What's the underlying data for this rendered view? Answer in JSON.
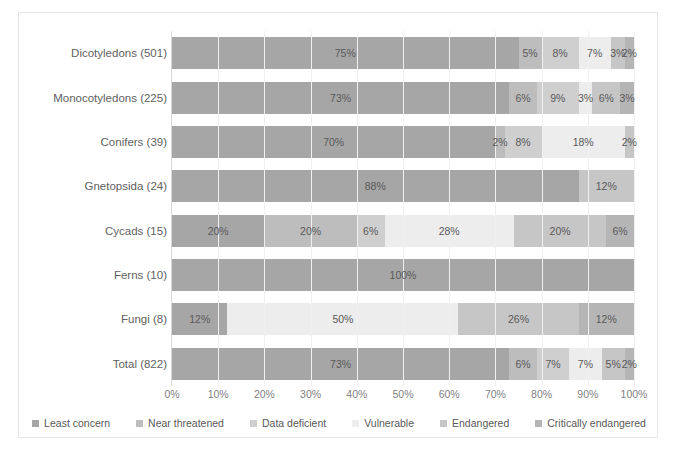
{
  "chart_data": {
    "type": "bar",
    "orientation": "horizontal",
    "stacked": true,
    "normalized": true,
    "title": "",
    "xlabel": "",
    "ylabel": "",
    "xlim": [
      0,
      100
    ],
    "grid": true,
    "legend_position": "bottom",
    "xtick_labels": [
      "0%",
      "10%",
      "20%",
      "30%",
      "40%",
      "50%",
      "60%",
      "70%",
      "80%",
      "90%",
      "100%"
    ],
    "xticks": [
      0,
      10,
      20,
      30,
      40,
      50,
      60,
      70,
      80,
      90,
      100
    ],
    "categories": [
      "Dicotyledons (501)",
      "Monocotyledons (225)",
      "Conifers (39)",
      "Gnetopsida (24)",
      "Cycads (15)",
      "Ferns (10)",
      "Fungi (8)",
      "Total (822)"
    ],
    "series": [
      {
        "name": "Least concern",
        "color": "#a6a6a6",
        "values": [
          75,
          73,
          70,
          88,
          20,
          100,
          12,
          73
        ],
        "labels": [
          "75%",
          "73%",
          "70%",
          "88%",
          "20%",
          "100%",
          "12%",
          "73%"
        ]
      },
      {
        "name": "Near threatened",
        "color": "#bdbdbd",
        "values": [
          5,
          6,
          2,
          0,
          20,
          0,
          0,
          6
        ],
        "labels": [
          "5%",
          "6%",
          "2%",
          "",
          "20%",
          "",
          "",
          "6%"
        ]
      },
      {
        "name": "Data deficient",
        "color": "#cfcfcf",
        "values": [
          8,
          9,
          8,
          0,
          6,
          0,
          0,
          7
        ],
        "labels": [
          "8%",
          "9%",
          "8%",
          "",
          "6%",
          "",
          "",
          "7%"
        ]
      },
      {
        "name": "Vulnerable",
        "color": "#ededed",
        "values": [
          7,
          3,
          18,
          0,
          28,
          0,
          50,
          7
        ],
        "labels": [
          "7%",
          "3%",
          "18%",
          "",
          "28%",
          "",
          "50%",
          "7%"
        ]
      },
      {
        "name": "Endangered",
        "color": "#c6c6c6",
        "values": [
          3,
          6,
          2,
          12,
          20,
          0,
          26,
          5
        ],
        "labels": [
          "3%",
          "6%",
          "2%",
          "12%",
          "20%",
          "",
          "26%",
          "5%"
        ]
      },
      {
        "name": "Critically endangered",
        "color": "#b5b5b5",
        "values": [
          2,
          3,
          0,
          0,
          6,
          0,
          12,
          2
        ],
        "labels": [
          "2%",
          "3%",
          "",
          "",
          "6%",
          "",
          "12%",
          "2%"
        ]
      }
    ]
  }
}
